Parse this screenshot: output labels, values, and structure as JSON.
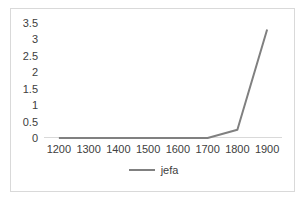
{
  "chart_data": {
    "type": "line",
    "title": "",
    "xlabel": "",
    "ylabel": "",
    "categories": [
      1200,
      1300,
      1400,
      1500,
      1600,
      1700,
      1800,
      1900
    ],
    "xtick_labels": [
      "1200",
      "1300",
      "1400",
      "1500",
      "1600",
      "1700",
      "1800",
      "1900"
    ],
    "ytick_labels": [
      "0",
      "0.5",
      "1",
      "1.5",
      "2",
      "2.5",
      "3",
      "3.5"
    ],
    "ytick_values": [
      0,
      0.5,
      1,
      1.5,
      2,
      2.5,
      3,
      3.5
    ],
    "ylim": [
      0,
      3.5
    ],
    "grid": false,
    "legend_position": "bottom-center",
    "series": [
      {
        "name": "jefa",
        "color": "#808080",
        "values": [
          0,
          0,
          0,
          0,
          0,
          0,
          0.25,
          3.3
        ]
      }
    ]
  },
  "legend": {
    "entries": [
      {
        "label": "jefa",
        "color": "#808080"
      }
    ]
  },
  "colors": {
    "series": "#808080",
    "axis": "#d9d9d9",
    "border": "#d9d9d9",
    "text": "#404040",
    "background": "#ffffff"
  }
}
